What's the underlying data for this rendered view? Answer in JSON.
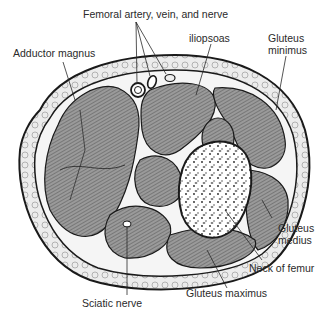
{
  "figure": {
    "labels": {
      "femoral": "Femoral artery, vein, and nerve",
      "adductor": "Adductor magnus",
      "iliopsoas": "iliopsoas",
      "gluteus_minimus": "Gluteus\nminimus",
      "gluteus_medius": "Gluteus\nmedius",
      "neck_femur": "Neck of femur",
      "gluteus_maximus": "Gluteus maximus",
      "sciatic": "Sciatic nerve"
    },
    "colors": {
      "muscle": "#8a8a8a",
      "fat": "#e6e6e6",
      "bone": "#ffffff",
      "outline": "#1a1a1a"
    }
  }
}
